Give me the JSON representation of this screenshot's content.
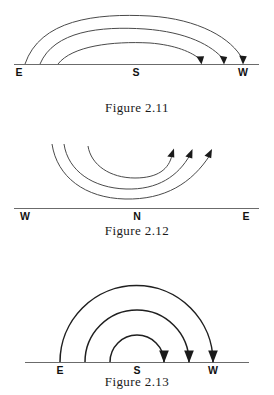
{
  "page": {
    "background_color": "#ffffff",
    "ink_color": "#1a1a1a",
    "width": 274,
    "height": 395
  },
  "figures": [
    {
      "id": "figure-2-11",
      "caption": "Figure 2.11",
      "description": "Three flattened arcs rising from the left horizon and descending to arrowheads on the horizon line; apparent daily paths of the sun arcing from east to west across the southern sky.",
      "baseline": {
        "label_left": "E",
        "label_middle": "S",
        "label_right": "W"
      },
      "labels": [
        "E",
        "S",
        "W"
      ],
      "arc_count": 3,
      "arrow_direction": "toward-west",
      "arrowhead_style": "filled-triangle",
      "line_color": "#4a4a4a",
      "baseline_color": "#6b6b6b"
    },
    {
      "id": "figure-2-12",
      "caption": "Figure 2.12",
      "description": "Three upward-opening U-shaped arcs dipping toward the horizon and rising to arrowheads aimed up and to the right; paths passing low across the northern sky.",
      "baseline": {
        "label_left": "W",
        "label_middle": "N",
        "label_right": "E"
      },
      "labels": [
        "W",
        "N",
        "E"
      ],
      "arc_count": 3,
      "arrow_direction": "up-and-right",
      "arrowhead_style": "filled-triangle",
      "line_color": "#4a4a4a",
      "baseline_color": "#6b6b6b"
    },
    {
      "id": "figure-2-13",
      "caption": "Figure 2.13",
      "description": "Three nested semicircular arcs rising vertically from the horizon and descending vertically to downward arrowheads on the horizon; paths crossing the sky at steep angles.",
      "baseline": {
        "label_left": "E",
        "label_middle": "S",
        "label_right": "W"
      },
      "labels": [
        "E",
        "S",
        "W"
      ],
      "arc_count": 3,
      "arrow_direction": "downward",
      "arrowhead_style": "filled-triangle",
      "line_color": "#1f1f1f",
      "baseline_color": "#6b6b6b"
    }
  ]
}
